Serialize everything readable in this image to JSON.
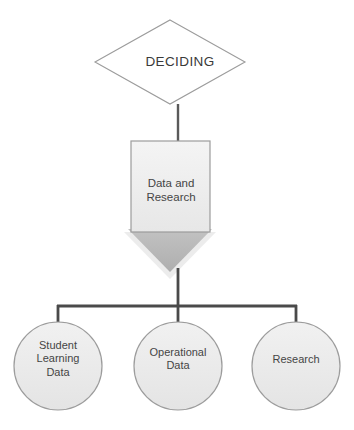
{
  "diagram": {
    "type": "flowchart",
    "title": "DECIDING",
    "canvas": {
      "width": 354,
      "height": 430,
      "background": "#ffffff"
    },
    "colors": {
      "connector": "#4a4a4a",
      "shape_outline": "#9a9a9a",
      "box_fill": "#efefef",
      "circle_fill": "#ededed",
      "arrow_fill": "#b5b5b5",
      "arrow_shadow": "#e4e4e4",
      "text": "#454545",
      "diamond_fill": "#ffffff"
    },
    "nodes": {
      "decision": {
        "shape": "diamond",
        "label": "DECIDING",
        "fill": "#ffffff",
        "stroke": "#9a9a9a"
      },
      "process": {
        "shape": "rectangle",
        "label": "Data and\nResearch",
        "fill": "#efefef",
        "stroke": "#9a9a9a"
      },
      "flow_arrow": {
        "shape": "down-arrow",
        "label": "",
        "fill": "#b5b5b5"
      }
    },
    "children": [
      {
        "id": "student-learning-data",
        "shape": "circle",
        "label": "Student\nLearning\nData",
        "fill": "#ededed",
        "stroke": "#9a9a9a"
      },
      {
        "id": "operational-data",
        "shape": "circle",
        "label": "Operational\nData",
        "fill": "#ededed",
        "stroke": "#9a9a9a"
      },
      {
        "id": "research",
        "shape": "circle",
        "label": "Research",
        "fill": "#ededed",
        "stroke": "#9a9a9a"
      }
    ]
  }
}
